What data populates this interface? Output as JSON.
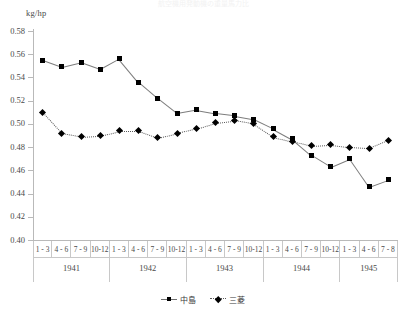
{
  "title_faint": "航空機用発動機の重量馬力比",
  "axis": {
    "y_unit": "kg/hp",
    "y_ticks": [
      "0.58",
      "0.56",
      "0.54",
      "0.52",
      "0.50",
      "0.48",
      "0.46",
      "0.44",
      "0.42",
      "0.40"
    ]
  },
  "quarters": [
    "1 - 3",
    "4 - 6",
    "7 - 9",
    "10-12",
    "1 - 3",
    "4 - 6",
    "7 - 9",
    "10-12",
    "1 - 3",
    "4 - 6",
    "7 - 9",
    "10-12",
    "1 - 3",
    "4 - 6",
    "7 - 9",
    "10-12",
    "1 - 3",
    "4 - 6",
    "7 - 8"
  ],
  "years": [
    {
      "label": "1941",
      "span": 4
    },
    {
      "label": "1942",
      "span": 4
    },
    {
      "label": "1943",
      "span": 4
    },
    {
      "label": "1944",
      "span": 4
    },
    {
      "label": "1945",
      "span": 3
    }
  ],
  "legend": [
    {
      "name": "中島",
      "marker": "square",
      "line": "solid"
    },
    {
      "name": "三菱",
      "marker": "diamond",
      "line": "dotted"
    }
  ],
  "chart_data": {
    "type": "line",
    "title": "航空機用発動機の重量馬力比",
    "xlabel": "",
    "ylabel": "kg/hp",
    "ylim": [
      0.4,
      0.58
    ],
    "ytick_step": 0.02,
    "grid": false,
    "legend_position": "bottom",
    "x": [
      "1941 1-3",
      "1941 4-6",
      "1941 7-9",
      "1941 10-12",
      "1942 1-3",
      "1942 4-6",
      "1942 7-9",
      "1942 10-12",
      "1943 1-3",
      "1943 4-6",
      "1943 7-9",
      "1943 10-12",
      "1944 1-3",
      "1944 4-6",
      "1944 7-9",
      "1944 10-12",
      "1945 1-3",
      "1945 4-6",
      "1945 7-8"
    ],
    "series": [
      {
        "name": "中島",
        "marker": "square",
        "line": "solid",
        "values": [
          0.555,
          0.549,
          0.553,
          0.547,
          0.556,
          0.536,
          0.522,
          0.509,
          0.512,
          0.509,
          0.507,
          0.504,
          0.496,
          0.487,
          0.473,
          0.463,
          0.47,
          0.446,
          0.452
        ]
      },
      {
        "name": "三菱",
        "marker": "diamond",
        "line": "dotted",
        "values": [
          0.51,
          0.492,
          0.489,
          0.49,
          0.494,
          0.494,
          0.488,
          0.492,
          0.496,
          0.501,
          0.503,
          0.5,
          0.489,
          0.485,
          0.481,
          0.482,
          0.48,
          0.479,
          0.486
        ]
      }
    ]
  }
}
